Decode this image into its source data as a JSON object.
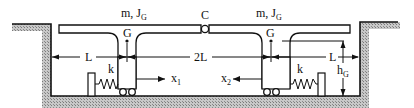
{
  "diagram": {
    "bodies": {
      "left": {
        "mass_label": "m, J",
        "mass_label_sub": "G",
        "center_label": "G",
        "displacement_label": "x",
        "displacement_sub": "1",
        "spring_label": "k"
      },
      "right": {
        "mass_label": "m, J",
        "mass_label_sub": "G",
        "center_label": "G",
        "displacement_label": "x",
        "displacement_sub": "2",
        "spring_label": "k"
      }
    },
    "hinge_label": "C",
    "dimensions": {
      "left_L": "L",
      "center_2L": "2L",
      "right_L": "L",
      "height_label": "h",
      "height_sub": "G"
    },
    "colors": {
      "line": "#111111",
      "ground_hatch": "#9a9a9a",
      "background": "#ffffff"
    }
  }
}
